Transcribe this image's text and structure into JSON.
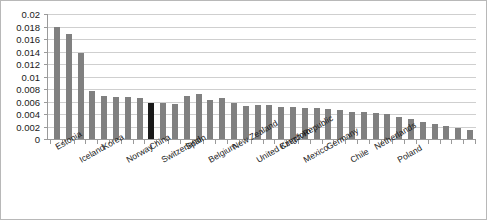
{
  "chart_data": {
    "type": "bar",
    "title": "",
    "xlabel": "",
    "ylabel": "",
    "ylim": [
      0,
      0.02
    ],
    "ytick_labels": [
      "0.02",
      "0.018",
      "0.016",
      "0.014",
      "0.012",
      "0.01",
      "0.008",
      "0.006",
      "0.004",
      "0.002",
      "0"
    ],
    "ytick_values": [
      0.02,
      0.018,
      0.016,
      0.014,
      0.012,
      0.01,
      0.008,
      0.006,
      0.004,
      0.002,
      0
    ],
    "grid": true,
    "legend": "none",
    "bar_color": "#808080",
    "highlight_color": "#1a1a1a",
    "highlight_category": "China",
    "labeled_categories": [
      "Estonia",
      "Iceland",
      "Korea",
      "Norway",
      "China",
      "Switzerland",
      "Spain",
      "Belgium",
      "New Zealand",
      "United Kingdom",
      "Czech Republic",
      "Mexico",
      "Germany",
      "Chile",
      "Netherlands",
      "Poland"
    ],
    "categories": [
      "Estonia",
      "",
      "Iceland",
      "",
      "Korea",
      "",
      "Norway",
      "",
      "China",
      "Switzerland",
      "",
      "Spain",
      "",
      "Belgium",
      "",
      "New Zealand",
      "",
      "United Kingdom",
      "",
      "Czech Republic",
      "",
      "Mexico",
      "",
      "Germany",
      "",
      "Chile",
      "",
      "Netherlands",
      "",
      "Poland",
      "",
      "",
      "",
      "",
      "",
      ""
    ],
    "values": [
      0.018,
      0.0168,
      0.0138,
      0.0077,
      0.0069,
      0.0068,
      0.0067,
      0.0066,
      0.0058,
      0.0057,
      0.0056,
      0.0069,
      0.0072,
      0.0063,
      0.0065,
      0.0057,
      0.0053,
      0.0055,
      0.0054,
      0.0052,
      0.0051,
      0.005,
      0.0049,
      0.0048,
      0.0046,
      0.0044,
      0.0043,
      0.0042,
      0.004,
      0.0036,
      0.0032,
      0.0028,
      0.0024,
      0.0021,
      0.0018,
      0.0015
    ],
    "highlight_index": 8
  }
}
